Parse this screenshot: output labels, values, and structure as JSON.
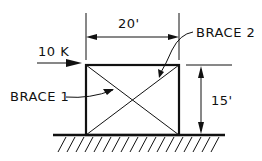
{
  "diagram": {
    "type": "braced-frame",
    "labels": {
      "width_dim": "20'",
      "height_dim": "15'",
      "load": "10 K",
      "brace1": "BRACE 1",
      "brace2": "BRACE 2"
    },
    "colors": {
      "ink": "#111111",
      "background": "#ffffff"
    }
  }
}
